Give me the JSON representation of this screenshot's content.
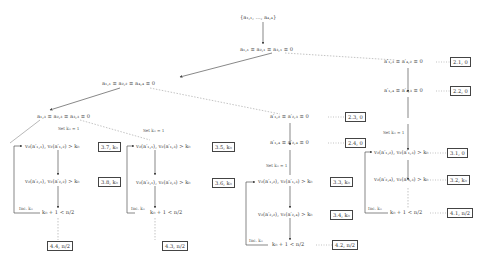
{
  "diagram": {
    "root": "{a₁,₁, …, a₄,₄}",
    "nodes": {
      "n1": "a₁,₁ ≡ a₂,₁ ≡ a₃,₁ ≡ 0",
      "n2": "a₁,₁ ≡ a₂,₂ ≡ a₄,₄ ≡ 0",
      "n3": "a₁,₃ ≡ a₂,₃ ≡ a₃,₃ ≡ 0",
      "r1": "a′₁,₃ ≡ a′₄,₂ ≡ 0",
      "r2": "a′₁,₄ ≡ a′₄,₃ ≡ 0",
      "m1": "a′₁,₂ ≡ a′₂,₃ ≡ 0",
      "m2": "a′₁,₄ ≡ a′₂,₄ ≡ 0",
      "a1": "v₂(a′₁,₁), v₂(a′₁,₂) > k₀",
      "a2": "v₂(a′₂,₁), v₂(a′₂,₂) > k₀",
      "a3": "k₀ + 1 < n/2",
      "b1": "v₂(a′₁,₁), v₂(a′₁,₃) > k₀",
      "b2": "v₂(a′₂,₁), v₂(a′₂,₃) > k₀",
      "b3": "k₀ + 1 < n/2",
      "c1": "v₂(a′₁,₂), v₂(a′₁,₃) > k₀",
      "c2": "v₂(a′₂,₂), v₂(a′₂,₄) > k₀",
      "c3": "k₀ + 1 < n/2",
      "d1": "v₂(a′₁,₂), v₂(a′₁,₃) > k₀",
      "d2": "v₂(a′₂,₄), v₂(a′₃,₃) > k₀",
      "d3": "k₀ + 1 < n/2"
    },
    "boxes": {
      "b_21": "2.1, 0",
      "b_22": "2.2, 0",
      "b_23": "2.3, 0",
      "b_24": "2.4, 0",
      "b_31": "3.1, 0",
      "b_32": "3.2, k₀",
      "b_33": "3.3, k₀",
      "b_34": "3.4, k₀",
      "b_35": "3.5, k₀",
      "b_36": "3.6, k₀",
      "b_37": "3.7, k₀",
      "b_38": "3.8, k₀",
      "b_41": "4.1, n/2",
      "b_42": "4.2, n/2",
      "b_43": "4.3, n/2",
      "b_44": "4.4, n/2"
    },
    "edge_labels": {
      "set_k0_1a": "Set k₀ = 1",
      "set_k0_1b": "Set k₀ = 1",
      "set_k0_1c": "Set k₀ = 1",
      "set_k0_1d": "Set k₀ = 1",
      "inc_a": "Inc. k₀",
      "inc_b": "Inc. k₀",
      "inc_c": "Inc. k₀",
      "inc_d": "Inc. k₀"
    }
  }
}
